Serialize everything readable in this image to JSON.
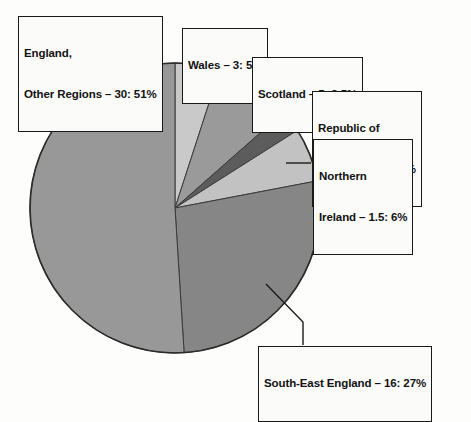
{
  "chart_data": {
    "type": "pie",
    "title": "",
    "categories": [
      "England, Other Regions",
      "Wales",
      "Scotland",
      "Republic of Ireland",
      "Northern Ireland",
      "South-East England"
    ],
    "values": [
      51,
      5,
      8.5,
      2.5,
      6,
      27
    ],
    "value_unit": "percent",
    "secondary_values": [
      30,
      3,
      5,
      3.6,
      1.5,
      16
    ],
    "secondary_unit": "count",
    "legend": "none",
    "grid": false,
    "start_angle_deg": 0,
    "direction": "clockwise",
    "slices": [
      {
        "name": "Wales",
        "count": "3",
        "percent": "5%",
        "color": "#c9c9c9",
        "start_deg": 0.0,
        "end_deg": 18.0
      },
      {
        "name": "Scotland",
        "count": "5",
        "percent": "8.5%",
        "color": "#9a9a9a",
        "start_deg": 18.0,
        "end_deg": 48.6
      },
      {
        "name": "Republic of Ireland",
        "count": "3.6",
        "percent": "2.5%",
        "color": "#5c5c5c",
        "start_deg": 48.6,
        "end_deg": 57.6
      },
      {
        "name": "Northern Ireland",
        "count": "1.5",
        "percent": "6%",
        "color": "#c2c2c2",
        "start_deg": 57.6,
        "end_deg": 79.2
      },
      {
        "name": "South-East England",
        "count": "16",
        "percent": "27%",
        "color": "#868686",
        "start_deg": 79.2,
        "end_deg": 176.4
      },
      {
        "name": "England, Other Regions",
        "count": "30",
        "percent": "51%",
        "color": "#989898",
        "start_deg": 176.4,
        "end_deg": 360.0
      }
    ]
  },
  "labels": {
    "england": {
      "line1": "England,",
      "line2": "Other Regions – 30: 51%"
    },
    "wales": {
      "line1": "Wales – 3: 5%"
    },
    "scotland": {
      "line1": "Scotland – 5: 8.5%"
    },
    "republic_of_ireland": {
      "line1": "Republic of",
      "line2": "Ireland – 3.6: 2.5%"
    },
    "northern_ireland": {
      "line1": "Northern",
      "line2": "Ireland – 1.5: 6%"
    },
    "south_east_england": {
      "line1": "South-East England – 16: 27%"
    }
  },
  "colors": {
    "outline": "#191919",
    "page_background": "#fdfdfb",
    "label_background": "#fbfbf9"
  }
}
